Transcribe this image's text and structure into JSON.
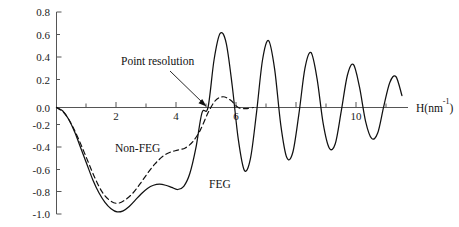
{
  "chart_data": {
    "type": "line",
    "title": "",
    "xlabel": "H(nm⁻¹)",
    "ylabel": "",
    "xlim": [
      0,
      11.6
    ],
    "ylim": [
      -1.0,
      0.8
    ],
    "grid": false,
    "legend": "inline-labels",
    "x_ticks_major": [
      2,
      4,
      6,
      10
    ],
    "x_tick_labels": [
      "2",
      "4",
      "6",
      "10"
    ],
    "x_ticks_minor": [
      1,
      3,
      5,
      7,
      8,
      9,
      11
    ],
    "y_ticks": [
      -1.0,
      -0.8,
      -0.6,
      -0.4,
      -0.2,
      0.0,
      0.2,
      0.4,
      0.6,
      0.8
    ],
    "y_tick_labels": [
      "-1.0",
      "-0.8",
      "-0.6",
      "-0.4",
      "-0.2",
      "0.0",
      "0.2",
      "0.4",
      "0.6",
      "0.8"
    ],
    "annotations": [
      {
        "text": "Point resolution",
        "x": 3.35,
        "y": 0.42,
        "points_to_x": 5.02,
        "points_to_y": 0.0
      },
      {
        "text": "Non-FEG",
        "x": 2.55,
        "y": -0.47
      },
      {
        "text": "FEG",
        "x": 5.12,
        "y": -0.68
      }
    ],
    "series": [
      {
        "name": "FEG",
        "style": "solid",
        "color": "#111111",
        "description": "Contrast transfer function for field-emission gun; oscillating with slowly decaying envelope out to 11.5 nm^-1",
        "x": [
          0.0,
          0.2,
          0.4,
          0.6,
          0.8,
          1.0,
          1.2,
          1.4,
          1.6,
          1.8,
          2.0,
          2.2,
          2.4,
          2.6,
          2.8,
          3.0,
          3.2,
          3.4,
          3.6,
          3.8,
          4.0,
          4.2,
          4.4,
          4.6,
          4.8,
          5.0,
          5.2,
          5.4,
          5.6,
          5.8,
          6.0,
          6.2,
          6.4,
          6.6,
          6.8,
          7.0,
          7.2,
          7.4,
          7.6,
          7.8,
          8.0,
          8.2,
          8.4,
          8.6,
          8.8,
          9.0,
          9.2,
          9.4,
          9.6,
          9.8,
          10.0,
          10.2,
          10.4,
          10.6,
          10.8,
          11.0,
          11.2,
          11.4
        ],
        "y": [
          0.0,
          -0.03,
          -0.11,
          -0.23,
          -0.38,
          -0.53,
          -0.68,
          -0.8,
          -0.89,
          -0.95,
          -0.98,
          -0.97,
          -0.93,
          -0.87,
          -0.81,
          -0.76,
          -0.73,
          -0.72,
          -0.73,
          -0.75,
          -0.77,
          -0.74,
          -0.62,
          -0.38,
          -0.05,
          0.0,
          0.4,
          0.62,
          0.54,
          0.18,
          -0.3,
          -0.59,
          -0.48,
          -0.05,
          0.4,
          0.56,
          0.32,
          -0.16,
          -0.47,
          -0.42,
          -0.06,
          0.33,
          0.46,
          0.24,
          -0.15,
          -0.38,
          -0.34,
          -0.03,
          0.27,
          0.36,
          0.17,
          -0.13,
          -0.29,
          -0.24,
          0.01,
          0.21,
          0.26,
          0.1
        ]
      },
      {
        "name": "Non-FEG",
        "style": "dashed",
        "color": "#111111",
        "description": "Contrast transfer function for thermionic (non-FEG) source; strongly damped, dies out beyond about 6 nm^-1",
        "x": [
          0.0,
          0.25,
          0.5,
          0.75,
          1.0,
          1.25,
          1.5,
          1.75,
          2.0,
          2.25,
          2.5,
          2.75,
          3.0,
          3.25,
          3.5,
          3.75,
          4.0,
          4.25,
          4.5,
          4.75,
          5.0,
          5.25,
          5.5,
          5.75,
          6.0,
          6.25,
          6.5
        ],
        "y": [
          0.0,
          -0.05,
          -0.16,
          -0.31,
          -0.48,
          -0.65,
          -0.79,
          -0.87,
          -0.9,
          -0.87,
          -0.81,
          -0.72,
          -0.62,
          -0.53,
          -0.46,
          -0.42,
          -0.4,
          -0.38,
          -0.32,
          -0.21,
          -0.05,
          0.06,
          0.09,
          0.06,
          0.0,
          -0.01,
          0.0
        ]
      }
    ]
  },
  "axis_title": {
    "base": "H(nm",
    "superscript": "-1",
    "close": ")"
  }
}
